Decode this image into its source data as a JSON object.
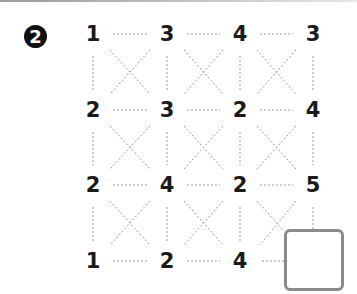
{
  "problem": {
    "number_label": "2",
    "grid": {
      "rows": [
        [
          "1",
          "3",
          "4",
          "3"
        ],
        [
          "2",
          "3",
          "2",
          "4"
        ],
        [
          "2",
          "4",
          "2",
          "5"
        ],
        [
          "1",
          "2",
          "4",
          ""
        ]
      ],
      "connections": {
        "horizontal": "dashed lines between adjacent numbers in each row",
        "vertical": "dashed lines between adjacent numbers in each column",
        "diagonal": "dashed X in every cell"
      }
    },
    "answer_box": {
      "value": ""
    }
  },
  "colors": {
    "number": "#1a1a1a",
    "dashed_line": "#9a9a9a",
    "badge_bg": "#111111",
    "answer_border": "#8a8a8a"
  }
}
